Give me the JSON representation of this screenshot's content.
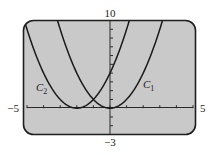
{
  "chart_data": {
    "type": "line",
    "title": "",
    "xlabel": "",
    "ylabel": "",
    "xlim": [
      -5,
      5
    ],
    "ylim": [
      -3,
      10
    ],
    "grid": false,
    "x_tick_step": 1,
    "y_tick_step": 1,
    "tick_labels": {
      "x_min": "−5",
      "x_max": "5",
      "y_min": "−3",
      "y_max": "10"
    },
    "series": [
      {
        "name": "C1",
        "label_main": "C",
        "label_sub": "1",
        "equation": "y = x^2",
        "vertex": [
          0,
          0
        ],
        "h": 0
      },
      {
        "name": "C2",
        "label_main": "C",
        "label_sub": "2",
        "equation": "y = (x+2)^2",
        "vertex": [
          -2,
          0
        ],
        "h": -2
      }
    ],
    "legend": "inline curve labels"
  },
  "colors": {
    "screen_bg": "#c9c9c9",
    "frame": "#1e1e1e",
    "curve": "#1a1a1a",
    "axis": "#2a2a2a"
  }
}
